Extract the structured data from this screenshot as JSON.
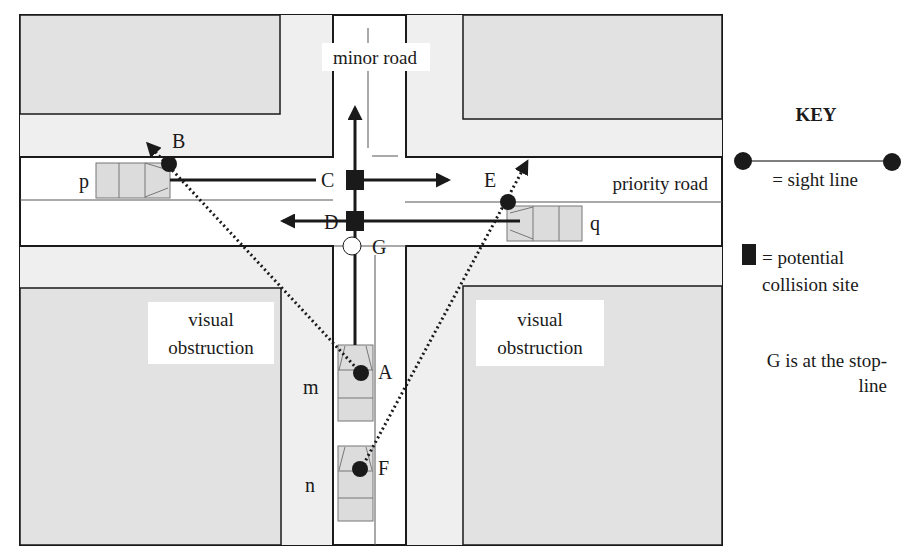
{
  "diagram": {
    "roads": {
      "minor": "minor road",
      "priority": "priority road"
    },
    "obstructions": {
      "left": [
        "visual",
        "obstruction"
      ],
      "right": [
        "visual",
        "obstruction"
      ]
    },
    "points": {
      "A": "A",
      "B": "B",
      "C": "C",
      "D": "D",
      "E": "E",
      "F": "F",
      "G": "G"
    },
    "vehicles": {
      "m": "m",
      "n": "n",
      "p": "p",
      "q": "q"
    }
  },
  "key": {
    "title": "KEY",
    "sight_line": "= sight line",
    "collision_1": "= potential",
    "collision_2": "collision site",
    "note_1": "G is at the stop-",
    "note_2": "line"
  },
  "colors": {
    "block_fill": "#e6e6e6",
    "vehicle_fill": "#dcdcdc",
    "ink": "#1a1a1a",
    "road": "#ffffff"
  }
}
